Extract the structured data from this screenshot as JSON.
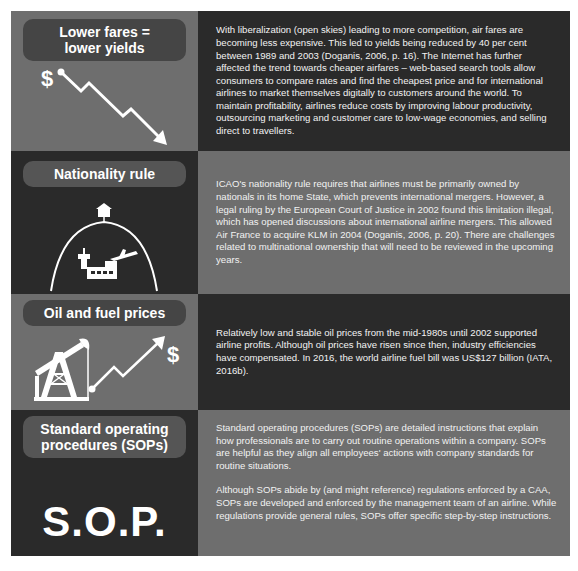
{
  "sections": [
    {
      "title": "Lower fares = lower yields",
      "title_lines": [
        "Lower fares =",
        "lower yields"
      ],
      "icon": "dollar-down-trend-icon",
      "icon_symbol": "$",
      "paragraphs": [
        "With liberalization (open skies) leading to more competition, air fares are becoming less expensive. This led to yields being reduced by 40 per cent between 1989 and 2003 (Doganis, 2006, p. 16). The Internet has further affected the trend towards cheaper airfares – web-based search tools allow consumers to compare rates and find the cheapest price and for international airlines to market themselves digitally to customers around the world. To maintain profitability, airlines reduce costs by improving labour productivity, outsourcing marketing and customer care to low-wage economies, and selling direct to travellers."
      ]
    },
    {
      "title": "Nationality rule",
      "icon": "airport-under-dome-icon",
      "paragraphs": [
        "ICAO's nationality rule requires that airlines must be primarily owned by nationals in its home State, which prevents international mergers. However, a legal ruling by the European Court of Justice in 2002 found this limitation illegal, which has opened discussions about international airline mergers. This allowed Air France to acquire KLM in 2004 (Doganis, 2006, p. 20). There are challenges related to multinational ownership that will need to be reviewed in the upcoming years."
      ]
    },
    {
      "title": "Oil and fuel prices",
      "icon": "oil-pump-up-trend-icon",
      "icon_symbol": "$",
      "paragraphs": [
        "Relatively low and stable oil prices from the mid-1980s until 2002 supported airline profits. Although oil prices have risen since then, industry efficiencies have compensated. In 2016, the world airline fuel bill was US$127 billion (IATA, 2016b)."
      ]
    },
    {
      "title": "Standard operating procedures (SOPs)",
      "title_lines": [
        "Standard operating",
        "procedures (SOPs)"
      ],
      "icon": "sop-text-icon",
      "icon_text": "S.O.P.",
      "paragraphs": [
        "Standard operating procedures (SOPs) are detailed instructions that explain how professionals are to carry out routine operations within a company. SOPs are helpful as they align all employees' actions with company standards for routine situations.",
        "Although SOPs abide by (and might reference) regulations enforced by a CAA,\nSOPs are developed and enforced by the management team of an airline. While regulations provide general rules, SOPs offer specific step-by-step instructions."
      ]
    }
  ],
  "colors": {
    "mid_gray": "#6e6e6e",
    "dark_gray": "#2a2a2a",
    "text": "#f2f2f2"
  }
}
